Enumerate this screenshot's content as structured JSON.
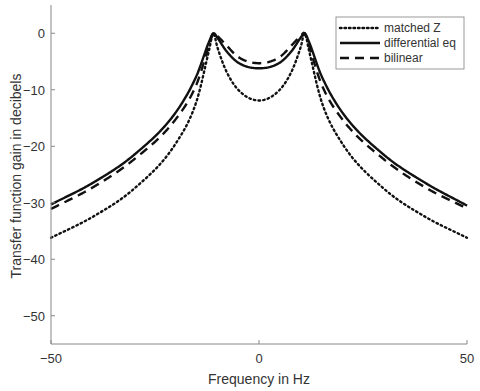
{
  "chart_data": {
    "type": "line",
    "title": "",
    "xlabel": "Frequency in Hz",
    "ylabel": "Transfer function gain in decibels",
    "xlim": [
      -50,
      50
    ],
    "ylim": [
      -55,
      5
    ],
    "xticks": [
      -50,
      0,
      50
    ],
    "yticks": [
      0,
      -10,
      -20,
      -30,
      -40,
      -50
    ],
    "grid": false,
    "legend_position": "upper right",
    "x": [
      -50,
      -40,
      -30,
      -20,
      -15,
      -12,
      -11,
      -10,
      -8,
      -5,
      0,
      5,
      8,
      10,
      11,
      12,
      15,
      20,
      30,
      40,
      50
    ],
    "series": [
      {
        "name": "matched Z",
        "style": "dotted",
        "values": [
          -36.2,
          -32.5,
          -27.5,
          -19.5,
          -12.0,
          -3.0,
          0.0,
          -2.5,
          -6.5,
          -10.0,
          -11.9,
          -10.0,
          -6.5,
          -2.5,
          0.0,
          -3.0,
          -12.0,
          -19.5,
          -27.5,
          -32.5,
          -36.2
        ]
      },
      {
        "name": "differential eq",
        "style": "solid",
        "values": [
          -30.3,
          -26.5,
          -21.5,
          -14.0,
          -7.5,
          -1.5,
          0.0,
          -0.8,
          -3.0,
          -5.2,
          -6.2,
          -5.2,
          -3.0,
          -0.8,
          0.0,
          -1.5,
          -7.5,
          -14.0,
          -21.5,
          -26.5,
          -30.5
        ]
      },
      {
        "name": "bilinear",
        "style": "dashed",
        "values": [
          -31.1,
          -27.3,
          -22.3,
          -15.2,
          -9.0,
          -2.2,
          0.0,
          -0.5,
          -2.0,
          -4.2,
          -5.3,
          -4.2,
          -2.0,
          -0.5,
          0.0,
          -2.2,
          -9.0,
          -15.2,
          -22.3,
          -27.3,
          -31.0
        ]
      }
    ]
  },
  "legend": {
    "items": [
      "matched Z",
      "differential eq",
      "bilinear"
    ]
  },
  "axes": {
    "ytick_labels": [
      "0",
      "−10",
      "−20",
      "−30",
      "−40",
      "−50"
    ],
    "xtick_labels": [
      "−50",
      "0",
      "50"
    ]
  }
}
